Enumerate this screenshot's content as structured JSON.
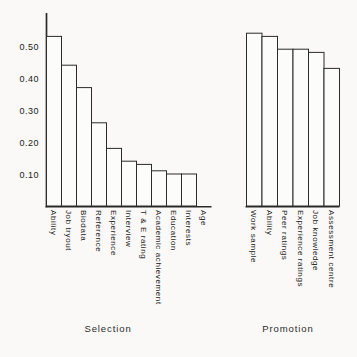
{
  "chart_data": {
    "type": "bar",
    "title": "",
    "xlabel": "",
    "ylabel": "",
    "ylim": [
      0,
      0.55
    ],
    "grid": false,
    "legend": false,
    "bar_outline_only": true,
    "yticks": [
      {
        "value": 0.5,
        "label": "0.50"
      },
      {
        "value": 0.4,
        "label": "0.40"
      },
      {
        "value": 0.3,
        "label": "0.30"
      },
      {
        "value": 0.2,
        "label": "0.20"
      },
      {
        "value": 0.1,
        "label": "0.10"
      }
    ],
    "groups": [
      {
        "label": "Selection",
        "categories": [
          "Ability",
          "Job tryout",
          "Biodata",
          "Reference",
          "Experience",
          "Interview",
          "T & E rating",
          "Academic achievement",
          "Education",
          "Interests",
          "Age"
        ],
        "values": [
          0.53,
          0.44,
          0.37,
          0.26,
          0.18,
          0.14,
          0.13,
          0.11,
          0.1,
          0.1,
          0.0
        ]
      },
      {
        "label": "Promotion",
        "categories": [
          "Work sample",
          "Ability",
          "Peer ratings",
          "Experience ratings",
          "Job knowledge",
          "Assessment centre"
        ],
        "values": [
          0.54,
          0.53,
          0.49,
          0.49,
          0.48,
          0.43
        ]
      }
    ],
    "colors": {
      "line": "#2b2b2b",
      "text": "#222222",
      "bar_fill": "#fcfcfa",
      "background": "#faf9f7"
    }
  }
}
